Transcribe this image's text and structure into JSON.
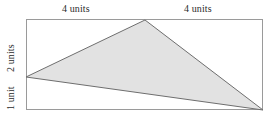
{
  "figure": {
    "type": "geometry-diagram",
    "labels": {
      "top_left": "4 units",
      "top_right": "4 units",
      "left_upper": "2 units",
      "left_lower": "1 unit"
    },
    "colors": {
      "triangle_fill": "#e2e2e2",
      "triangle_stroke": "#6e6e6e",
      "rectangle_stroke": "#9a9a9a",
      "background": "#ffffff",
      "text": "#2b2b2b"
    },
    "geometry": {
      "rectangle": {
        "x": 26,
        "y": 19,
        "width": 237,
        "height": 91
      },
      "triangle_points": "26,77 145,20 263,110",
      "vertices": {
        "left": [
          26,
          77
        ],
        "apex": [
          145,
          20
        ],
        "right": [
          263,
          110
        ]
      }
    }
  }
}
